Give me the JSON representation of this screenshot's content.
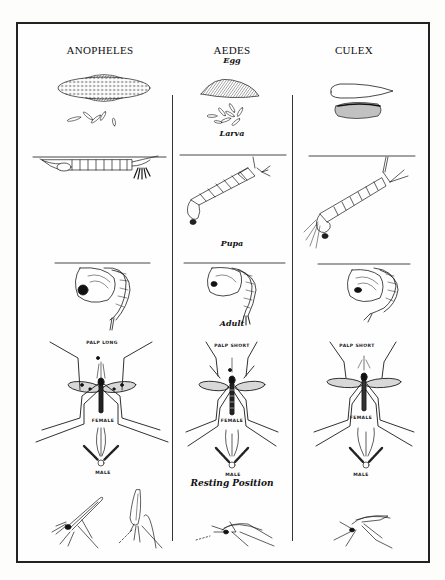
{
  "diagram": {
    "type": "comparative life-cycle illustration",
    "columns": [
      {
        "id": "anopheles",
        "title": "ANOPHELES",
        "palp_label": "PALP LONG",
        "female_label": "FEMALE",
        "male_label": "MALE"
      },
      {
        "id": "aedes",
        "title": "AEDES",
        "palp_label": "PALP SHORT",
        "female_label": "FEMALE",
        "male_label": "MALE"
      },
      {
        "id": "culex",
        "title": "CULEX",
        "palp_label": "PALP SHORT",
        "female_label": "FEMALE",
        "male_label": "MALE"
      }
    ],
    "stages": {
      "egg": "Egg",
      "larva": "Larva",
      "pupa": "Pupa",
      "adult": "Adult",
      "resting": "Resting Position"
    },
    "colors": {
      "ink": "#1a1a1a",
      "paper": "#fefefe",
      "frame": "#222222"
    }
  }
}
